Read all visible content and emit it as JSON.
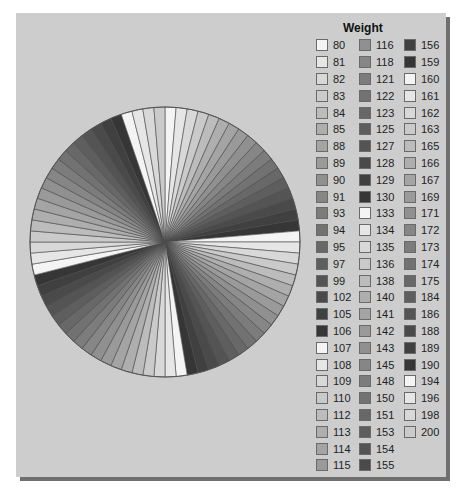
{
  "chart_data": {
    "type": "pie",
    "title": "",
    "legend_title": "Weight",
    "legend_position": "right",
    "start_angle_deg": 0,
    "direction": "clockwise",
    "categories": [
      80,
      81,
      82,
      83,
      84,
      85,
      88,
      89,
      90,
      91,
      93,
      94,
      95,
      97,
      99,
      102,
      105,
      106,
      107,
      108,
      109,
      110,
      112,
      113,
      114,
      115,
      116,
      118,
      121,
      122,
      123,
      125,
      127,
      128,
      129,
      130,
      133,
      134,
      135,
      136,
      138,
      140,
      141,
      142,
      143,
      145,
      148,
      150,
      151,
      153,
      154,
      155,
      156,
      159,
      160,
      161,
      162,
      163,
      165,
      166,
      167,
      169,
      171,
      172,
      173,
      174,
      175,
      184,
      186,
      188,
      189,
      190,
      194,
      196,
      198,
      200
    ],
    "values": [
      1,
      1,
      1,
      1,
      1,
      1,
      1,
      1,
      1,
      1,
      1,
      1,
      1,
      1,
      1,
      1,
      1,
      1,
      1,
      1,
      1,
      1,
      1,
      1,
      1,
      1,
      1,
      1,
      1,
      1,
      1,
      1,
      1,
      1,
      1,
      1,
      1,
      1,
      1,
      1,
      1,
      1,
      1,
      1,
      1,
      1,
      1,
      1,
      1,
      1,
      1,
      1,
      1,
      1,
      1,
      1,
      1,
      1,
      1,
      1,
      1,
      1,
      1,
      1,
      1,
      1,
      1,
      1,
      1,
      1,
      1,
      1,
      1,
      1,
      1,
      1
    ],
    "colors": [
      "#f4f4f4",
      "#e6e6e6",
      "#d8d8d8",
      "#cacaca",
      "#bcbcbc",
      "#aeaeae",
      "#a4a4a4",
      "#9a9a9a",
      "#909090",
      "#868686",
      "#7c7c7c",
      "#727272",
      "#686868",
      "#5e5e5e",
      "#545454",
      "#4a4a4a",
      "#404040",
      "#363636",
      "#f4f4f4",
      "#e6e6e6",
      "#d8d8d8",
      "#cacaca",
      "#bcbcbc",
      "#aeaeae",
      "#a4a4a4",
      "#9a9a9a",
      "#909090",
      "#868686",
      "#7c7c7c",
      "#727272",
      "#686868",
      "#5e5e5e",
      "#545454",
      "#4a4a4a",
      "#404040",
      "#363636",
      "#f4f4f4",
      "#e6e6e6",
      "#d8d8d8",
      "#cacaca",
      "#bcbcbc",
      "#aeaeae",
      "#a4a4a4",
      "#9a9a9a",
      "#909090",
      "#868686",
      "#7c7c7c",
      "#727272",
      "#686868",
      "#5e5e5e",
      "#545454",
      "#4a4a4a",
      "#404040",
      "#363636",
      "#f4f4f4",
      "#e6e6e6",
      "#d8d8d8",
      "#cacaca",
      "#bcbcbc",
      "#aeaeae",
      "#a4a4a4",
      "#9a9a9a",
      "#909090",
      "#868686",
      "#7c7c7c",
      "#727272",
      "#686868",
      "#5e5e5e",
      "#545454",
      "#4a4a4a",
      "#404040",
      "#363636",
      "#f4f4f4",
      "#e6e6e6",
      "#d8d8d8",
      "#cacaca"
    ]
  },
  "legend": {
    "title": "Weight",
    "columns": [
      [
        "80",
        "81",
        "82",
        "83",
        "84",
        "85",
        "88",
        "89",
        "90",
        "91",
        "93",
        "94",
        "95",
        "97",
        "99",
        "102",
        "105",
        "106",
        "107",
        "108",
        "109",
        "110",
        "112",
        "113",
        "114",
        "115"
      ],
      [
        "116",
        "118",
        "121",
        "122",
        "123",
        "125",
        "127",
        "128",
        "129",
        "130",
        "133",
        "134",
        "135",
        "136",
        "138",
        "140",
        "141",
        "142",
        "143",
        "145",
        "148",
        "150",
        "151",
        "153",
        "154",
        "155"
      ],
      [
        "156",
        "159",
        "160",
        "161",
        "162",
        "163",
        "165",
        "166",
        "167",
        "169",
        "171",
        "172",
        "173",
        "174",
        "175",
        "184",
        "186",
        "188",
        "189",
        "190",
        "194",
        "196",
        "198",
        "200"
      ]
    ]
  }
}
